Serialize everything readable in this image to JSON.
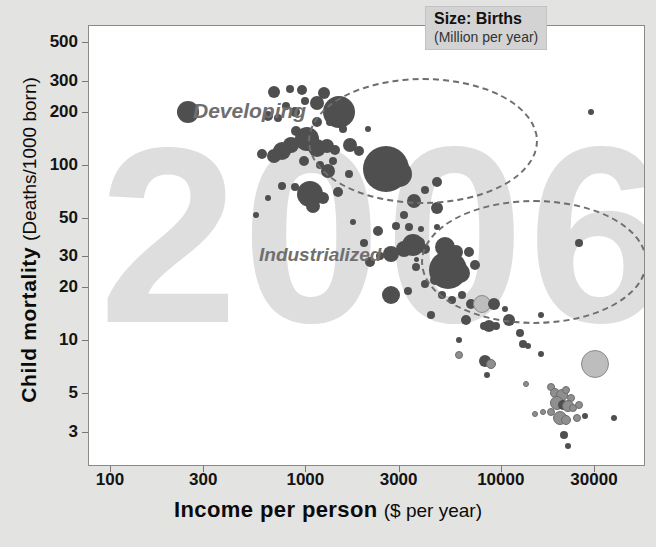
{
  "chart_data": {
    "type": "scatter",
    "title": "",
    "xlabel": "Income per person",
    "xlabel_unit": "($ per year)",
    "ylabel": "Child mortality",
    "ylabel_unit": "(Deaths/1000 born)",
    "xscale": "log",
    "yscale": "log",
    "xlim": [
      80,
      45000
    ],
    "ylim": [
      2.3,
      620
    ],
    "xticks": [
      "100",
      "300",
      "1000",
      "3000",
      "10000",
      "30000"
    ],
    "xtick_values": [
      100,
      300,
      1000,
      3000,
      10000,
      30000
    ],
    "yticks": [
      "500",
      "300",
      "200",
      "100",
      "50",
      "30",
      "20",
      "10",
      "5",
      "3"
    ],
    "ytick_values": [
      500,
      300,
      200,
      100,
      50,
      30,
      20,
      10,
      5,
      3
    ],
    "grid": false,
    "size_legend_title": "Size: Births",
    "size_legend_unit": "(Million per year)",
    "watermark": "2006",
    "annotations": [
      {
        "text": "Developing",
        "x": 250,
        "y": 300
      },
      {
        "text": "Industrialized",
        "x": 900,
        "y": 45
      }
    ],
    "clusters": [
      {
        "label": "Developing",
        "cx": 1400,
        "cy": 170
      },
      {
        "label": "Industrialized",
        "cx": 4200,
        "cy": 38
      }
    ],
    "points": [
      {
        "x": 250,
        "y": 200,
        "r": 11,
        "c": "dark"
      },
      {
        "x": 690,
        "y": 260,
        "r": 6,
        "c": "dark"
      },
      {
        "x": 830,
        "y": 270,
        "r": 4,
        "c": "dark"
      },
      {
        "x": 960,
        "y": 265,
        "r": 5,
        "c": "dark"
      },
      {
        "x": 640,
        "y": 190,
        "r": 5,
        "c": "dark"
      },
      {
        "x": 720,
        "y": 185,
        "r": 4,
        "c": "dark"
      },
      {
        "x": 800,
        "y": 215,
        "r": 4,
        "c": "dark"
      },
      {
        "x": 880,
        "y": 200,
        "r": 5,
        "c": "dark"
      },
      {
        "x": 1000,
        "y": 230,
        "r": 4,
        "c": "dark"
      },
      {
        "x": 1150,
        "y": 225,
        "r": 7,
        "c": "dark"
      },
      {
        "x": 1250,
        "y": 255,
        "r": 6,
        "c": "dark"
      },
      {
        "x": 1480,
        "y": 200,
        "r": 16,
        "c": "dark"
      },
      {
        "x": 1150,
        "y": 175,
        "r": 5,
        "c": "dark"
      },
      {
        "x": 1330,
        "y": 175,
        "r": 4,
        "c": "dark"
      },
      {
        "x": 1550,
        "y": 160,
        "r": 4,
        "c": "dark"
      },
      {
        "x": 2100,
        "y": 160,
        "r": 3,
        "c": "dark"
      },
      {
        "x": 900,
        "y": 155,
        "r": 5,
        "c": "dark"
      },
      {
        "x": 1020,
        "y": 140,
        "r": 12,
        "c": "dark"
      },
      {
        "x": 840,
        "y": 130,
        "r": 8,
        "c": "dark"
      },
      {
        "x": 760,
        "y": 120,
        "r": 9,
        "c": "dark"
      },
      {
        "x": 690,
        "y": 112,
        "r": 7,
        "c": "dark"
      },
      {
        "x": 1150,
        "y": 125,
        "r": 9,
        "c": "dark"
      },
      {
        "x": 1290,
        "y": 128,
        "r": 7,
        "c": "dark"
      },
      {
        "x": 1420,
        "y": 122,
        "r": 5,
        "c": "dark"
      },
      {
        "x": 1700,
        "y": 130,
        "r": 7,
        "c": "dark"
      },
      {
        "x": 1880,
        "y": 120,
        "r": 5,
        "c": "dark"
      },
      {
        "x": 980,
        "y": 105,
        "r": 5,
        "c": "dark"
      },
      {
        "x": 1190,
        "y": 100,
        "r": 4,
        "c": "dark"
      },
      {
        "x": 1300,
        "y": 92,
        "r": 7,
        "c": "dark"
      },
      {
        "x": 2600,
        "y": 95,
        "r": 23,
        "c": "dark"
      },
      {
        "x": 3000,
        "y": 88,
        "r": 13,
        "c": "dark"
      },
      {
        "x": 760,
        "y": 76,
        "r": 4,
        "c": "dark"
      },
      {
        "x": 880,
        "y": 75,
        "r": 4,
        "c": "dark"
      },
      {
        "x": 640,
        "y": 65,
        "r": 3,
        "c": "dark"
      },
      {
        "x": 1060,
        "y": 68,
        "r": 13,
        "c": "dark"
      },
      {
        "x": 1230,
        "y": 65,
        "r": 6,
        "c": "dark"
      },
      {
        "x": 1470,
        "y": 70,
        "r": 5,
        "c": "dark"
      },
      {
        "x": 1090,
        "y": 58,
        "r": 7,
        "c": "dark"
      },
      {
        "x": 560,
        "y": 52,
        "r": 3,
        "c": "dark"
      },
      {
        "x": 3600,
        "y": 62,
        "r": 7,
        "c": "dark"
      },
      {
        "x": 3200,
        "y": 52,
        "r": 4,
        "c": "dark"
      },
      {
        "x": 2350,
        "y": 42,
        "r": 5,
        "c": "dark"
      },
      {
        "x": 2900,
        "y": 45,
        "r": 4,
        "c": "dark"
      },
      {
        "x": 3400,
        "y": 44,
        "r": 4,
        "c": "dark"
      },
      {
        "x": 3900,
        "y": 43,
        "r": 3,
        "c": "dark"
      },
      {
        "x": 3200,
        "y": 33,
        "r": 8,
        "c": "dark"
      },
      {
        "x": 3550,
        "y": 35,
        "r": 11,
        "c": "dark"
      },
      {
        "x": 3800,
        "y": 36,
        "r": 6,
        "c": "dark"
      },
      {
        "x": 4100,
        "y": 33,
        "r": 5,
        "c": "dark"
      },
      {
        "x": 2750,
        "y": 31,
        "r": 8,
        "c": "dark"
      },
      {
        "x": 2400,
        "y": 30,
        "r": 4,
        "c": "dark"
      },
      {
        "x": 2150,
        "y": 28,
        "r": 5,
        "c": "dark"
      },
      {
        "x": 5200,
        "y": 34,
        "r": 10,
        "c": "dark"
      },
      {
        "x": 5900,
        "y": 32,
        "r": 7,
        "c": "dark"
      },
      {
        "x": 6900,
        "y": 32,
        "r": 5,
        "c": "dark"
      },
      {
        "x": 5400,
        "y": 25,
        "r": 19,
        "c": "dark"
      },
      {
        "x": 6200,
        "y": 24,
        "r": 10,
        "c": "dark"
      },
      {
        "x": 7400,
        "y": 27,
        "r": 5,
        "c": "dark"
      },
      {
        "x": 4600,
        "y": 22,
        "r": 5,
        "c": "dark"
      },
      {
        "x": 4100,
        "y": 21,
        "r": 4,
        "c": "dark"
      },
      {
        "x": 2750,
        "y": 18,
        "r": 9,
        "c": "dark"
      },
      {
        "x": 3350,
        "y": 19,
        "r": 4,
        "c": "dark"
      },
      {
        "x": 5000,
        "y": 18,
        "r": 4,
        "c": "dark"
      },
      {
        "x": 5600,
        "y": 17,
        "r": 4,
        "c": "dark"
      },
      {
        "x": 6300,
        "y": 18,
        "r": 4,
        "c": "dark"
      },
      {
        "x": 7000,
        "y": 16,
        "r": 5,
        "c": "dark"
      },
      {
        "x": 8000,
        "y": 16,
        "r": 9,
        "c": "light"
      },
      {
        "x": 9200,
        "y": 16,
        "r": 6,
        "c": "dark"
      },
      {
        "x": 10500,
        "y": 15,
        "r": 3,
        "c": "dark"
      },
      {
        "x": 6600,
        "y": 13,
        "r": 5,
        "c": "dark"
      },
      {
        "x": 8200,
        "y": 12,
        "r": 4,
        "c": "dark"
      },
      {
        "x": 8700,
        "y": 12,
        "r": 6,
        "c": "dark"
      },
      {
        "x": 9500,
        "y": 12,
        "r": 4,
        "c": "dark"
      },
      {
        "x": 6100,
        "y": 10,
        "r": 3,
        "c": "dark"
      },
      {
        "x": 6100,
        "y": 8.2,
        "r": 4,
        "c": "mid"
      },
      {
        "x": 13000,
        "y": 9.5,
        "r": 4,
        "c": "dark"
      },
      {
        "x": 13800,
        "y": 9.3,
        "r": 3,
        "c": "dark"
      },
      {
        "x": 8300,
        "y": 7.6,
        "r": 6,
        "c": "dark"
      },
      {
        "x": 8900,
        "y": 7.3,
        "r": 5,
        "c": "mid"
      },
      {
        "x": 8500,
        "y": 6.3,
        "r": 3,
        "c": "dark"
      },
      {
        "x": 30500,
        "y": 7.3,
        "r": 14,
        "c": "light"
      },
      {
        "x": 16000,
        "y": 8.3,
        "r": 3,
        "c": "dark"
      },
      {
        "x": 13500,
        "y": 5.6,
        "r": 3,
        "c": "mid"
      },
      {
        "x": 18000,
        "y": 5.4,
        "r": 4,
        "c": "mid"
      },
      {
        "x": 19000,
        "y": 5.0,
        "r": 5,
        "c": "mid"
      },
      {
        "x": 20500,
        "y": 4.9,
        "r": 6,
        "c": "mid"
      },
      {
        "x": 21500,
        "y": 5.2,
        "r": 4,
        "c": "mid"
      },
      {
        "x": 23000,
        "y": 4.7,
        "r": 4,
        "c": "mid"
      },
      {
        "x": 19500,
        "y": 4.4,
        "r": 7,
        "c": "mid"
      },
      {
        "x": 20800,
        "y": 4.3,
        "r": 5,
        "c": "dark"
      },
      {
        "x": 22000,
        "y": 4.2,
        "r": 6,
        "c": "mid"
      },
      {
        "x": 23500,
        "y": 4.1,
        "r": 4,
        "c": "mid"
      },
      {
        "x": 25000,
        "y": 4.3,
        "r": 4,
        "c": "mid"
      },
      {
        "x": 18000,
        "y": 3.9,
        "r": 4,
        "c": "mid"
      },
      {
        "x": 16500,
        "y": 3.9,
        "r": 3,
        "c": "mid"
      },
      {
        "x": 15000,
        "y": 3.8,
        "r": 3,
        "c": "mid"
      },
      {
        "x": 20000,
        "y": 3.6,
        "r": 7,
        "c": "mid"
      },
      {
        "x": 21500,
        "y": 3.5,
        "r": 5,
        "c": "mid"
      },
      {
        "x": 24500,
        "y": 3.6,
        "r": 4,
        "c": "mid"
      },
      {
        "x": 27000,
        "y": 3.7,
        "r": 3,
        "c": "dark"
      },
      {
        "x": 38000,
        "y": 3.6,
        "r": 3,
        "c": "dark"
      },
      {
        "x": 21000,
        "y": 2.9,
        "r": 4,
        "c": "dark"
      },
      {
        "x": 22000,
        "y": 2.5,
        "r": 3,
        "c": "dark"
      },
      {
        "x": 29000,
        "y": 200,
        "r": 3,
        "c": "dark"
      },
      {
        "x": 25000,
        "y": 36,
        "r": 4,
        "c": "dark"
      },
      {
        "x": 12500,
        "y": 11,
        "r": 4,
        "c": "dark"
      },
      {
        "x": 11000,
        "y": 13,
        "r": 6,
        "c": "dark"
      },
      {
        "x": 4400,
        "y": 14,
        "r": 4,
        "c": "dark"
      },
      {
        "x": 16000,
        "y": 14,
        "r": 3,
        "c": "dark"
      },
      {
        "x": 3700,
        "y": 26,
        "r": 4,
        "c": "dark"
      },
      {
        "x": 2000,
        "y": 36,
        "r": 4,
        "c": "dark"
      },
      {
        "x": 1750,
        "y": 47,
        "r": 3,
        "c": "dark"
      },
      {
        "x": 4700,
        "y": 44,
        "r": 3,
        "c": "dark"
      },
      {
        "x": 4700,
        "y": 57,
        "r": 6,
        "c": "dark"
      },
      {
        "x": 4100,
        "y": 72,
        "r": 4,
        "c": "dark"
      },
      {
        "x": 4700,
        "y": 80,
        "r": 5,
        "c": "dark"
      },
      {
        "x": 1680,
        "y": 88,
        "r": 4,
        "c": "dark"
      },
      {
        "x": 1380,
        "y": 105,
        "r": 4,
        "c": "dark"
      },
      {
        "x": 600,
        "y": 115,
        "r": 5,
        "c": "dark"
      }
    ]
  }
}
